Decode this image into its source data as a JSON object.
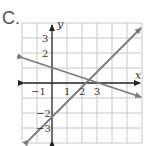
{
  "problem_label": "C.",
  "axes": {
    "x_label": "x",
    "y_label": "y",
    "x_ticks": [
      "−1",
      "1",
      "2",
      "3"
    ],
    "y_ticks": [
      "3",
      "2",
      "−2",
      "−3"
    ]
  },
  "lines": [
    {
      "name": "increasing-line",
      "through": [
        [
          0,
          -3
        ],
        [
          3,
          0
        ]
      ],
      "slope": 1
    },
    {
      "name": "decreasing-line",
      "through": [
        [
          0,
          1
        ],
        [
          3,
          0
        ]
      ],
      "slope": -0.333
    }
  ],
  "intersection": {
    "x": 3,
    "y": 0
  },
  "colors": {
    "grid": "#c8c8c8",
    "axis": "#222222",
    "line": "#7a7a7a",
    "text": "#333333"
  }
}
